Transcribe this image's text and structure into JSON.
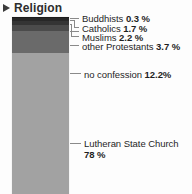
{
  "header": {
    "title": "Religion",
    "disclosure_icon": "triangle-right-icon",
    "expanded": false
  },
  "colors": {
    "background": "#fdfdfd",
    "text": "#1f1f1f",
    "leader_line": "#8a8a8a",
    "buddhists": "#1c1c1c",
    "catholics": "#2b2b2b",
    "muslims": "#3c3c3c",
    "other_protestants": "#555555",
    "no_confession": "#6f6f6f",
    "lutheran_state_church": "#a0a0a0"
  },
  "chart_data": {
    "type": "bar",
    "subtype": "stacked-100-vertical",
    "title": "Religion",
    "xlabel": "",
    "ylabel": "",
    "unit": "%",
    "ylim": [
      0,
      100
    ],
    "grid": false,
    "legend_position": "right-callout-labels",
    "categories": [
      "Religion"
    ],
    "order_top_to_bottom": [
      "Buddhists",
      "Catholics",
      "Muslims",
      "other Protestants",
      "no confession",
      "Lutheran State Church"
    ],
    "series": [
      {
        "name": "Buddhists",
        "values": [
          0.3
        ],
        "color": "#1c1c1c"
      },
      {
        "name": "Catholics",
        "values": [
          1.7
        ],
        "color": "#2b2b2b"
      },
      {
        "name": "Muslims",
        "values": [
          2.2
        ],
        "color": "#3c3c3c"
      },
      {
        "name": "other Protestants",
        "values": [
          3.7
        ],
        "color": "#555555"
      },
      {
        "name": "no confession",
        "values": [
          12.2
        ],
        "color": "#6f6f6f"
      },
      {
        "name": "Lutheran State Church",
        "values": [
          78
        ],
        "color": "#a0a0a0"
      }
    ]
  },
  "labels": {
    "buddhists": {
      "name": "Buddhists",
      "value": "0.3 %"
    },
    "catholics": {
      "name": "Catholics",
      "value": "1.7 %"
    },
    "muslims": {
      "name": "Muslims",
      "value": "2.2 %"
    },
    "other_protestants": {
      "name": "other Protestants",
      "value": "3.7 %"
    },
    "no_confession": {
      "name": "no confession",
      "value": "12.2%"
    },
    "lutheran": {
      "name": "Lutheran State Church",
      "value": "78 %"
    }
  }
}
